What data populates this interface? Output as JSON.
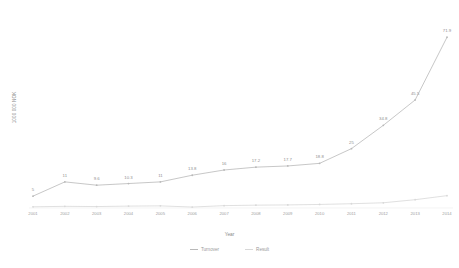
{
  "chart_data": {
    "type": "line",
    "title": "",
    "xlabel": "Year",
    "ylabel": "1000 000 NOK",
    "grid": false,
    "legend_position": "bottom",
    "categories": [
      "2001",
      "2002",
      "2003",
      "2004",
      "2005",
      "2006",
      "2007",
      "2008",
      "2009",
      "2010",
      "2011",
      "2012",
      "2013",
      "2014"
    ],
    "xlim": [
      2001,
      2014
    ],
    "ylim": [
      0,
      80
    ],
    "series": [
      {
        "name": "Turnover",
        "color": "#b9b9b9",
        "values": [
          5,
          11,
          9.6,
          10.3,
          11,
          13.8,
          16,
          17.2,
          17.7,
          18.8,
          25,
          34.8,
          45.5,
          71.9
        ],
        "labels": [
          "5",
          "11",
          "9.6",
          "10.3",
          "11",
          "13.8",
          "16",
          "17.2",
          "17.7",
          "18.8",
          "25",
          "34.8",
          "45.5",
          "71.9"
        ]
      },
      {
        "name": "Result",
        "color": "#d8d8d8",
        "values": [
          0.5,
          0.7,
          0.6,
          0.8,
          0.9,
          0.4,
          1.0,
          1.2,
          1.3,
          1.5,
          1.8,
          2.2,
          3.5,
          5.2
        ],
        "labels": [
          "",
          "",
          "",
          "",
          "",
          "",
          "",
          "",
          "",
          "",
          "",
          "",
          "",
          ""
        ]
      }
    ]
  },
  "legend": {
    "items": [
      {
        "label": "Turnover"
      },
      {
        "label": "Result"
      }
    ]
  },
  "axis": {
    "x_title": "Year",
    "y_title": "1000 000 NOK"
  }
}
